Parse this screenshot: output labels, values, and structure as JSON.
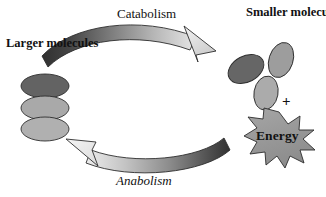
{
  "figure": {
    "background_color": "#ffffff"
  },
  "labels": {
    "larger_molecules": "Larger molecules",
    "smaller_molecules": "Smaller molecules",
    "catabolism": "Catabolism",
    "anabolism": "Anabolism",
    "energy": "Energy",
    "plus": "+"
  },
  "arrows": [
    {
      "name": "catabolism-arrow",
      "label": "Catabolism",
      "direction": "left-to-right",
      "gradient_start_color": "#3a3a3a",
      "gradient_end_color": "#e4e4e4",
      "curve": "arc-over-top"
    },
    {
      "name": "anabolism-arrow",
      "label": "Anabolism",
      "direction": "right-to-left",
      "gradient_start_color": "#3a3a3a",
      "gradient_end_color": "#e8e8e8",
      "curve": "arc-under-bottom"
    }
  ],
  "molecules": {
    "larger": [
      {
        "name": "larger-molecule-top",
        "fill": "#636363"
      },
      {
        "name": "larger-molecule-middle",
        "fill": "#a9a9a9"
      },
      {
        "name": "larger-molecule-bottom",
        "fill": "#b0b0b0"
      }
    ],
    "smaller": [
      {
        "name": "smaller-molecule-dark",
        "fill": "#666666"
      },
      {
        "name": "smaller-molecule-upper-right",
        "fill": "#9d9d9d"
      },
      {
        "name": "smaller-molecule-lower",
        "fill": "#ababab"
      }
    ]
  },
  "energy_burst": {
    "name": "energy-starburst",
    "fill": "#9a9a9a",
    "stroke": "#2b2b2b",
    "points": 12,
    "text": "Energy"
  },
  "colors": {
    "outline": "#2b2b2b",
    "dark_gray": "#636363",
    "light_gray": "#aaaaaa",
    "text": "#111111"
  }
}
